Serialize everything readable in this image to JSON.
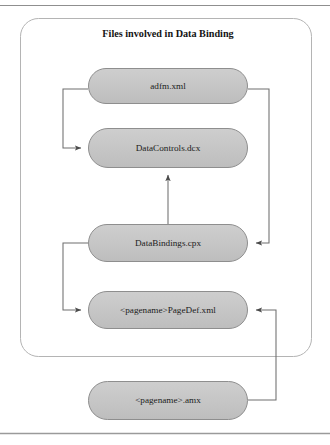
{
  "diagram": {
    "title": "Files involved in Data Binding",
    "container_label": "data-binding-files-group",
    "colors": {
      "node_fill": "#c6c6c6",
      "node_stroke": "#8e8e8e",
      "container_stroke": "#b4b4b4",
      "connector_stroke": "#6e6e6e",
      "page_rule": "#9a9a9a",
      "text": "#1c1c1c",
      "background": "#ffffff"
    },
    "nodes": [
      {
        "id": "adfm",
        "label": "adfm.xml",
        "x": 88,
        "y": 68,
        "w": 160,
        "h": 36
      },
      {
        "id": "datacontrols",
        "label": "DataControls.dcx",
        "x": 88,
        "y": 128,
        "w": 160,
        "h": 40
      },
      {
        "id": "databindings",
        "label": "DataBindings.cpx",
        "x": 88,
        "y": 224,
        "w": 160,
        "h": 38
      },
      {
        "id": "pagedef",
        "label": "<pagename>PageDef.xml",
        "x": 88,
        "y": 291,
        "w": 160,
        "h": 38
      },
      {
        "id": "amx",
        "label": "<pagename>.amx",
        "x": 88,
        "y": 381,
        "w": 160,
        "h": 39
      }
    ],
    "edges": [
      {
        "id": "adfm-to-datacontrols",
        "from": "adfm",
        "to": "datacontrols",
        "side": "left",
        "arrow": "right"
      },
      {
        "id": "adfm-to-databindings",
        "from": "adfm",
        "to": "databindings",
        "side": "right",
        "arrow": "left"
      },
      {
        "id": "databindings-to-datacontrols",
        "from": "databindings",
        "to": "datacontrols",
        "side": "center",
        "arrow": "up"
      },
      {
        "id": "databindings-to-pagedef",
        "from": "databindings",
        "to": "pagedef",
        "side": "left",
        "arrow": "right"
      },
      {
        "id": "amx-to-pagedef",
        "from": "amx",
        "to": "pagedef",
        "side": "right",
        "arrow": "left"
      }
    ],
    "container": {
      "x": 20,
      "y": 18,
      "w": 292,
      "h": 339,
      "radius": 18
    },
    "page_rules": [
      {
        "id": "top-rule",
        "y": 5
      },
      {
        "id": "bottom-rule",
        "y": 433
      }
    ]
  }
}
